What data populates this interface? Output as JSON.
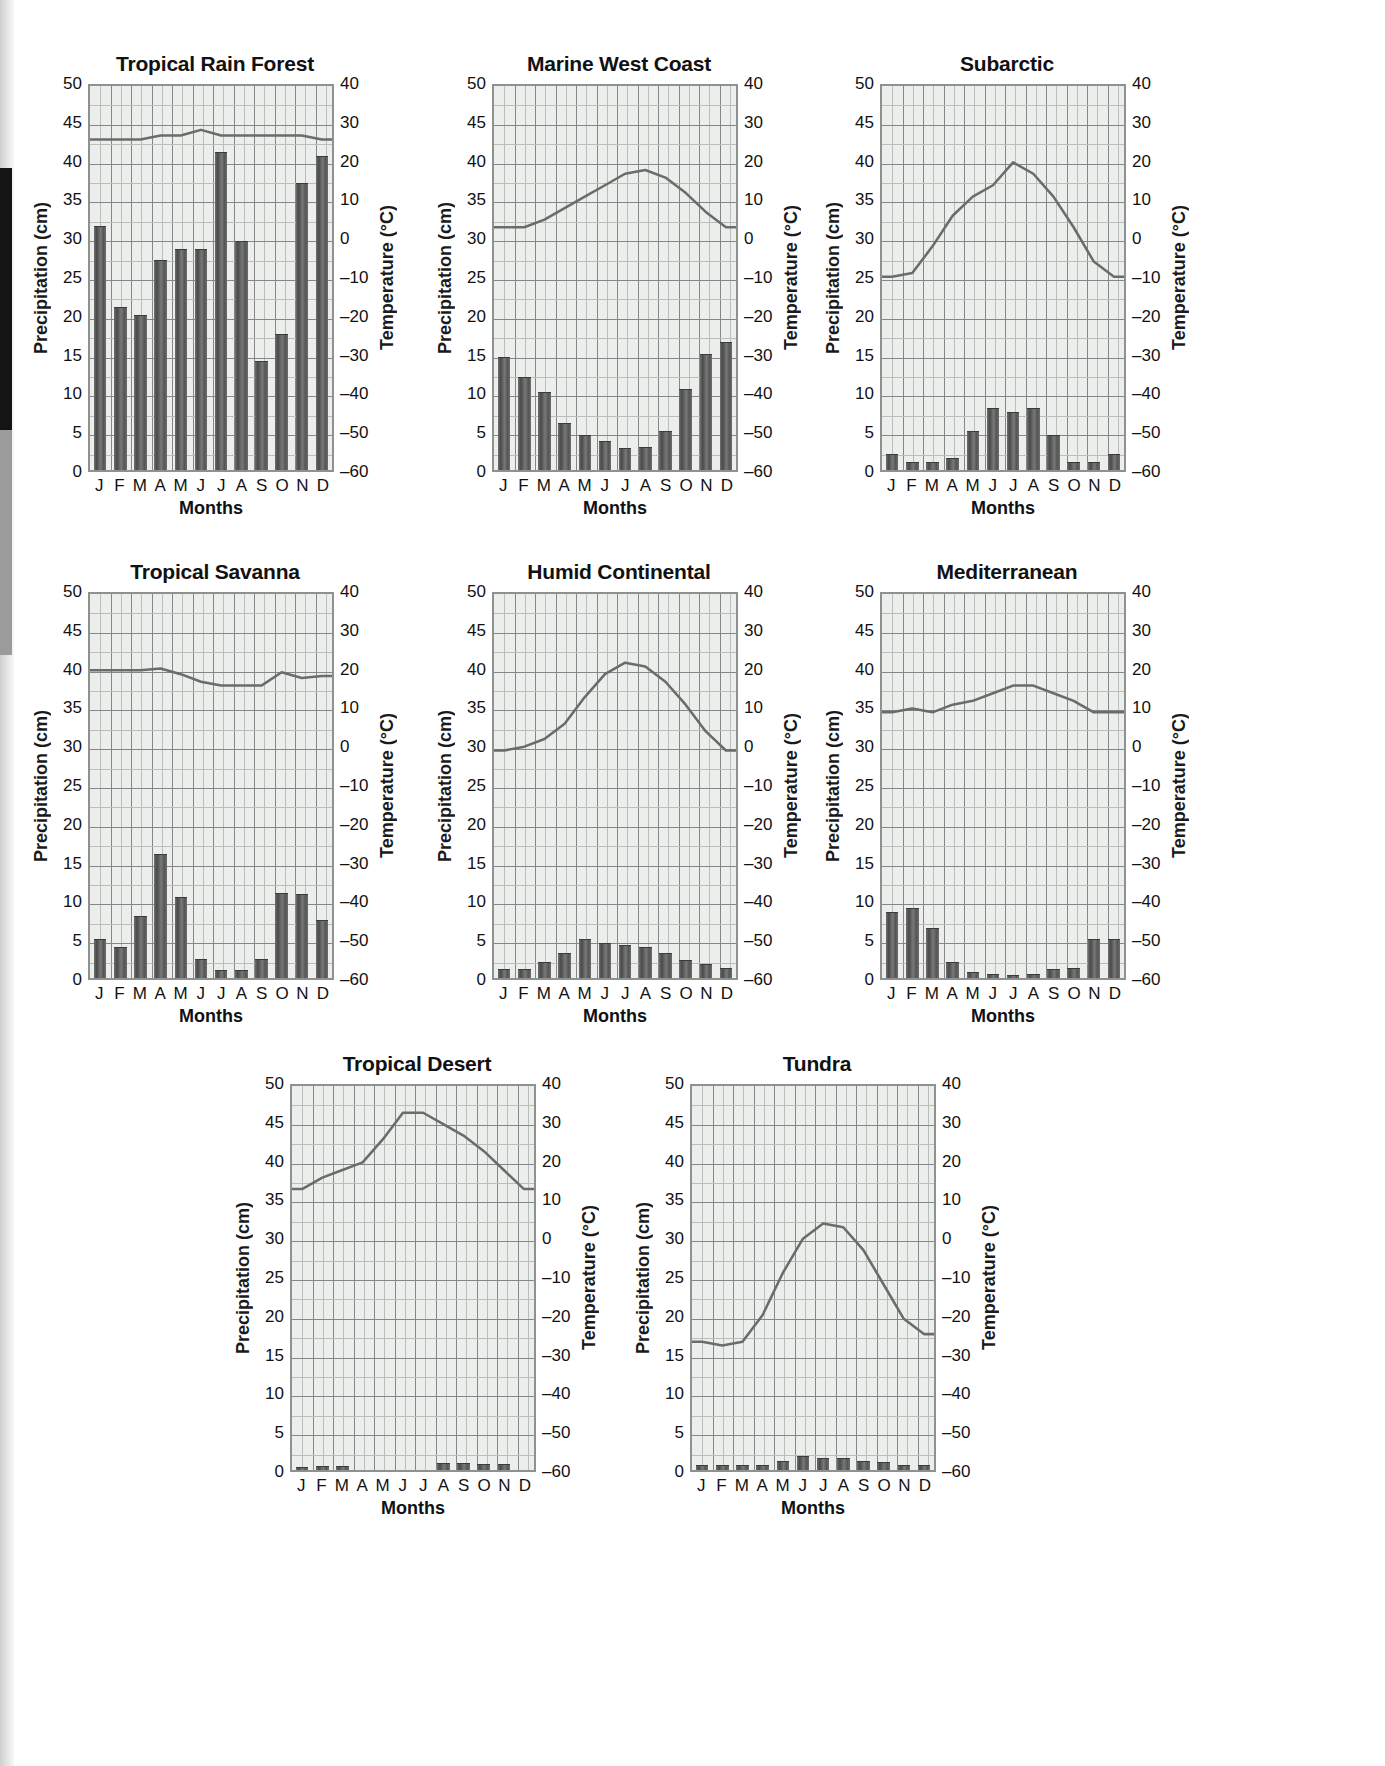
{
  "axes": {
    "left_title": "Precipitation (cm)",
    "right_title": "Temperature (°C)",
    "x_title": "Months",
    "precip_ticks": [
      "50",
      "45",
      "40",
      "35",
      "30",
      "25",
      "20",
      "15",
      "10",
      "5",
      "0"
    ],
    "temp_ticks": [
      "40",
      "30",
      "20",
      "10",
      "0",
      "–10",
      "–20",
      "–30",
      "–40",
      "–50",
      "–60"
    ],
    "month_labels": [
      "J",
      "F",
      "M",
      "A",
      "M",
      "J",
      "J",
      "A",
      "S",
      "O",
      "N",
      "D"
    ],
    "precip_range": [
      0,
      50
    ],
    "temp_range": [
      -60,
      40
    ]
  },
  "colors": {
    "bar": "#5c5c5c",
    "line": "#6b6b6b",
    "plot_bg": "#eceeec",
    "grid_minor": "#b9bdbb",
    "grid_major": "#83878a",
    "plot_border": "#8d918f",
    "text": "#111111"
  },
  "chart_data": [
    {
      "type": "bar",
      "title": "Tropical Rain Forest",
      "xlabel": "Months",
      "ylabel": "Precipitation (cm)",
      "y2label": "Temperature (°C)",
      "categories": [
        "J",
        "F",
        "M",
        "A",
        "M",
        "J",
        "J",
        "A",
        "S",
        "O",
        "N",
        "D"
      ],
      "ylim": [
        0,
        50
      ],
      "y2lim": [
        -60,
        40
      ],
      "grid": true,
      "series": [
        {
          "name": "Precipitation (cm)",
          "type": "bar",
          "values": [
            31.5,
            21,
            20,
            27,
            28.5,
            28.5,
            41,
            29.5,
            14,
            17.5,
            37,
            40.5
          ]
        },
        {
          "name": "Temperature (°C)",
          "type": "line",
          "values": [
            26,
            26,
            26,
            27,
            27,
            28.5,
            27,
            27,
            27,
            27,
            27,
            26
          ]
        }
      ]
    },
    {
      "type": "bar",
      "title": "Marine West Coast",
      "xlabel": "Months",
      "ylabel": "Precipitation (cm)",
      "y2label": "Temperature (°C)",
      "categories": [
        "J",
        "F",
        "M",
        "A",
        "M",
        "J",
        "J",
        "A",
        "S",
        "O",
        "N",
        "D"
      ],
      "ylim": [
        0,
        50
      ],
      "y2lim": [
        -60,
        40
      ],
      "grid": true,
      "series": [
        {
          "name": "Precipitation (cm)",
          "type": "bar",
          "values": [
            14.5,
            12,
            10,
            6,
            4.5,
            3.8,
            2.8,
            3,
            5,
            10.5,
            15,
            16.5
          ]
        },
        {
          "name": "Temperature (°C)",
          "type": "line",
          "values": [
            3,
            3,
            5,
            8,
            11,
            14,
            17,
            18,
            16,
            12,
            7,
            3
          ]
        }
      ]
    },
    {
      "type": "bar",
      "title": "Subarctic",
      "xlabel": "Months",
      "ylabel": "Precipitation (cm)",
      "y2label": "Temperature (°C)",
      "categories": [
        "J",
        "F",
        "M",
        "A",
        "M",
        "J",
        "J",
        "A",
        "S",
        "O",
        "N",
        "D"
      ],
      "ylim": [
        0,
        50
      ],
      "y2lim": [
        -60,
        40
      ],
      "grid": true,
      "series": [
        {
          "name": "Precipitation (cm)",
          "type": "bar",
          "values": [
            2,
            1,
            1,
            1.5,
            5,
            8,
            7.5,
            8,
            4.5,
            1,
            1,
            2
          ]
        },
        {
          "name": "Temperature (°C)",
          "type": "line",
          "values": [
            -10,
            -9,
            -2,
            6,
            11,
            14,
            20,
            17,
            11,
            3,
            -6,
            -10
          ]
        }
      ]
    },
    {
      "type": "bar",
      "title": "Tropical Savanna",
      "xlabel": "Months",
      "ylabel": "Precipitation (cm)",
      "y2label": "Temperature (°C)",
      "categories": [
        "J",
        "F",
        "M",
        "A",
        "M",
        "J",
        "J",
        "A",
        "S",
        "O",
        "N",
        "D"
      ],
      "ylim": [
        0,
        50
      ],
      "y2lim": [
        -60,
        40
      ],
      "grid": true,
      "series": [
        {
          "name": "Precipitation (cm)",
          "type": "bar",
          "values": [
            5,
            4,
            8,
            16,
            10.5,
            2.5,
            1,
            1,
            2.5,
            11,
            10.8,
            7.5
          ]
        },
        {
          "name": "Temperature (°C)",
          "type": "line",
          "values": [
            20,
            20,
            20,
            20.5,
            19,
            17,
            16,
            16,
            16,
            19.5,
            18,
            18.5
          ]
        }
      ]
    },
    {
      "type": "bar",
      "title": "Humid Continental",
      "xlabel": "Months",
      "ylabel": "Precipitation (cm)",
      "y2label": "Temperature (°C)",
      "categories": [
        "J",
        "F",
        "M",
        "A",
        "M",
        "J",
        "J",
        "A",
        "S",
        "O",
        "N",
        "D"
      ],
      "ylim": [
        0,
        50
      ],
      "y2lim": [
        -60,
        40
      ],
      "grid": true,
      "series": [
        {
          "name": "Precipitation (cm)",
          "type": "bar",
          "values": [
            1.2,
            1.2,
            2,
            3.2,
            5,
            4.5,
            4.3,
            4,
            3.2,
            2.3,
            1.8,
            1.3
          ]
        },
        {
          "name": "Temperature (°C)",
          "type": "line",
          "values": [
            -1,
            0,
            2,
            6,
            13,
            19,
            22,
            21,
            17,
            11,
            4,
            -1
          ]
        }
      ]
    },
    {
      "type": "bar",
      "title": "Mediterranean",
      "xlabel": "Months",
      "ylabel": "Precipitation (cm)",
      "y2label": "Temperature (°C)",
      "categories": [
        "J",
        "F",
        "M",
        "A",
        "M",
        "J",
        "J",
        "A",
        "S",
        "O",
        "N",
        "D"
      ],
      "ylim": [
        0,
        50
      ],
      "y2lim": [
        -60,
        40
      ],
      "grid": true,
      "series": [
        {
          "name": "Precipitation (cm)",
          "type": "bar",
          "values": [
            8.5,
            9,
            6.5,
            2,
            0.8,
            0.5,
            0.4,
            0.5,
            1.2,
            1.3,
            5,
            5
          ]
        },
        {
          "name": "Temperature (°C)",
          "type": "line",
          "values": [
            9,
            10,
            9,
            11,
            12,
            14,
            16,
            16,
            14,
            12,
            9,
            9
          ]
        }
      ]
    },
    {
      "type": "bar",
      "title": "Tropical Desert",
      "xlabel": "Months",
      "ylabel": "Precipitation (cm)",
      "y2label": "Temperature (°C)",
      "categories": [
        "J",
        "F",
        "M",
        "A",
        "M",
        "J",
        "J",
        "A",
        "S",
        "O",
        "N",
        "D"
      ],
      "ylim": [
        0,
        50
      ],
      "y2lim": [
        -60,
        40
      ],
      "grid": true,
      "series": [
        {
          "name": "Precipitation (cm)",
          "type": "bar",
          "values": [
            0.4,
            0.5,
            0.5,
            0,
            0,
            0,
            0,
            0.9,
            0.9,
            0.8,
            0.8,
            0
          ]
        },
        {
          "name": "Temperature (°C)",
          "type": "line",
          "values": [
            13,
            16,
            18,
            20,
            26,
            33,
            33,
            30,
            27,
            23,
            18,
            13
          ]
        }
      ]
    },
    {
      "type": "bar",
      "title": "Tundra",
      "xlabel": "Months",
      "ylabel": "Precipitation (cm)",
      "y2label": "Temperature (°C)",
      "categories": [
        "J",
        "F",
        "M",
        "A",
        "M",
        "J",
        "J",
        "A",
        "S",
        "O",
        "N",
        "D"
      ],
      "ylim": [
        0,
        50
      ],
      "y2lim": [
        -60,
        40
      ],
      "grid": true,
      "series": [
        {
          "name": "Precipitation (cm)",
          "type": "bar",
          "values": [
            0.6,
            0.6,
            0.6,
            0.6,
            1.2,
            1.8,
            1.5,
            1.5,
            1.2,
            1.0,
            0.6,
            0.6
          ]
        },
        {
          "name": "Temperature (°C)",
          "type": "line",
          "values": [
            -27,
            -28,
            -27,
            -20,
            -9,
            0,
            4,
            3,
            -3,
            -12,
            -21,
            -25
          ]
        }
      ]
    }
  ]
}
